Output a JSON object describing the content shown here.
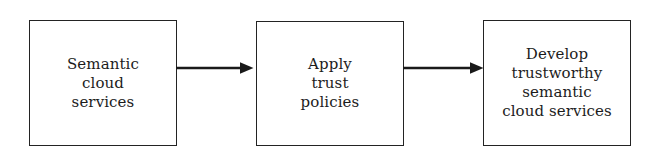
{
  "diagram": {
    "background_color": "#ffffff",
    "stroke_color": "#232323",
    "text_color": "#1c1c1c",
    "nodes": [
      {
        "id": "semantic-cloud-services",
        "lines": [
          "Semantic",
          "cloud",
          "services"
        ]
      },
      {
        "id": "apply-trust-policies",
        "lines": [
          "Apply",
          "trust",
          "policies"
        ]
      },
      {
        "id": "develop-trustworthy-semantic-cloud-services",
        "lines": [
          "Develop",
          "trustworthy",
          "semantic",
          "cloud services"
        ]
      }
    ],
    "connectors": [
      {
        "id": "arrow-1",
        "from": "semantic-cloud-services",
        "to": "apply-trust-policies",
        "label": "",
        "style": "solid-arrow-right"
      },
      {
        "id": "arrow-2",
        "from": "apply-trust-policies",
        "to": "develop-trustworthy-semantic-cloud-services",
        "label": "",
        "style": "solid-arrow-right"
      }
    ]
  }
}
